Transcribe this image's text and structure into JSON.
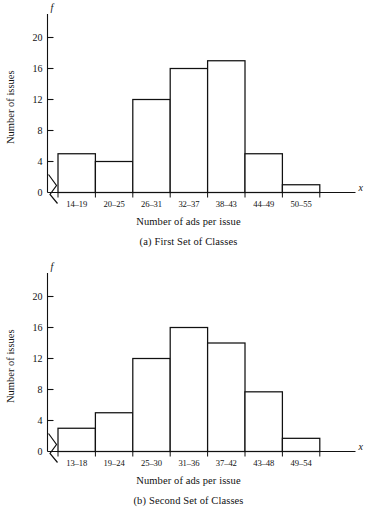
{
  "page": {
    "background": "#ffffff",
    "ink": "#111111"
  },
  "chart_data": [
    {
      "type": "bar",
      "id": "histogram-a",
      "title": "",
      "caption_label": "(a)",
      "caption_text": "First Set of Classes",
      "xlabel": "Number of ads per issue",
      "ylabel": "Number of issues",
      "x_axis_symbol": "x",
      "y_axis_symbol": "f",
      "categories": [
        "14–19",
        "20–25",
        "26–31",
        "32–37",
        "38–43",
        "44–49",
        "50–55"
      ],
      "values": [
        5,
        4,
        12,
        16,
        17,
        5,
        1
      ],
      "ylim": [
        0,
        22
      ],
      "yticks": [
        0,
        4,
        8,
        12,
        16,
        20
      ],
      "ytick_labels": [
        "0",
        "4",
        "8",
        "12",
        "16",
        "20"
      ],
      "grid": false,
      "legend": false,
      "axis_break": true,
      "bar_fill": "#ffffff",
      "bar_stroke": "#111111"
    },
    {
      "type": "bar",
      "id": "histogram-b",
      "title": "",
      "caption_label": "(b)",
      "caption_text": "Second Set of Classes",
      "xlabel": "Number of ads per issue",
      "ylabel": "Number of issues",
      "x_axis_symbol": "x",
      "y_axis_symbol": "f",
      "categories": [
        "13–18",
        "19–24",
        "25–30",
        "31–36",
        "37–42",
        "43–48",
        "49–54"
      ],
      "values": [
        3,
        5,
        12,
        16,
        14,
        7.7,
        1.7
      ],
      "ylim": [
        0,
        22
      ],
      "yticks": [
        0,
        4,
        8,
        12,
        16,
        20
      ],
      "ytick_labels": [
        "0",
        "4",
        "8",
        "12",
        "16",
        "20"
      ],
      "grid": false,
      "legend": false,
      "axis_break": true,
      "bar_fill": "#ffffff",
      "bar_stroke": "#111111"
    }
  ]
}
